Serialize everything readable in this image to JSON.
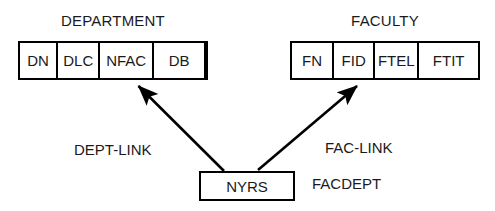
{
  "diagram": {
    "type": "entity-link-diagram",
    "entities": [
      {
        "name": "department",
        "title": "DEPARTMENT",
        "fields": [
          "DN",
          "DLC",
          "NFAC",
          "DB",
          ""
        ]
      },
      {
        "name": "faculty",
        "title": "FACULTY",
        "fields": [
          "FN",
          "FID",
          "FTEL",
          "FTIT"
        ]
      }
    ],
    "record": {
      "label": "NYRS"
    },
    "links": [
      {
        "name": "dept-link",
        "label": "DEPT-LINK",
        "from": "NYRS",
        "to": "DEPARTMENT.NFAC"
      },
      {
        "name": "fac-link",
        "label": "FAC-LINK",
        "from": "NYRS",
        "to": "FACULTY.FID"
      }
    ],
    "annotations": [
      {
        "name": "facdept",
        "label": "FACDEPT"
      }
    ],
    "colors": {
      "stroke": "#000000",
      "text": "#1a1a1a",
      "background": "#ffffff"
    }
  }
}
